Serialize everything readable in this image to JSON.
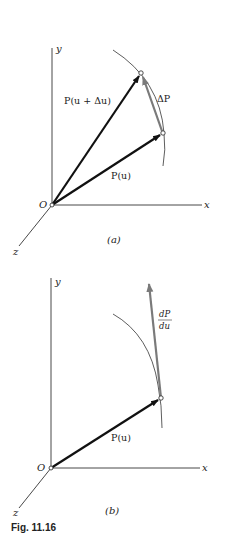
{
  "figure": {
    "caption": "Fig. 11.16",
    "panel_a": {
      "label": "(a)",
      "origin_label": "O",
      "axes": {
        "x": "x",
        "y": "y",
        "z": "z"
      },
      "vectors": [
        {
          "name": "P(u + Δu)",
          "label": "P(u + Δu)"
        },
        {
          "name": "P(u)",
          "label": "P(u)"
        },
        {
          "name": "ΔP",
          "label": "ΔP"
        }
      ]
    },
    "panel_b": {
      "label": "(b)",
      "origin_label": "O",
      "axes": {
        "x": "x",
        "y": "y",
        "z": "z"
      },
      "vectors": [
        {
          "name": "P(u)",
          "label": "P(u)"
        },
        {
          "name": "dP/du",
          "numerator": "dP",
          "denominator": "du"
        }
      ]
    },
    "colors": {
      "axis": "#333333",
      "vector": "#111111",
      "difference_vector": "#7a7a7a",
      "curve": "#333333"
    }
  }
}
